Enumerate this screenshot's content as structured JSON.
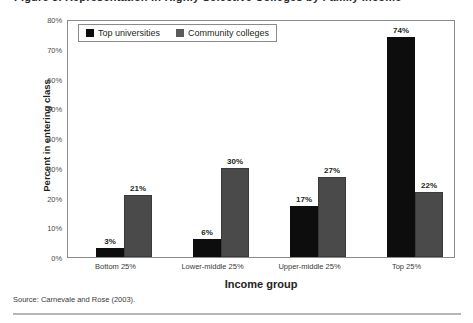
{
  "figure": {
    "title_remnant": "Figure 3. Representation in Highly Selective Colleges by Family Income",
    "source_note": "Source: Carnevale and Rose (2003).",
    "colors": {
      "series_top_universities": "#0d0d0d",
      "series_community_colleges": "#4a4a4a",
      "plot_border": "#8a8a8a",
      "axis_text": "#3a3a3a",
      "rule": "#b6b6bc",
      "background": "#ffffff"
    }
  },
  "legend": {
    "position": "top-left-inside",
    "items": [
      {
        "label": "Top universities",
        "swatch": "#0d0d0d"
      },
      {
        "label": "Community colleges",
        "swatch": "#5a5a5a"
      }
    ]
  },
  "axes": {
    "y_ticks": [
      "0%",
      "10%",
      "20%",
      "30%",
      "40%",
      "50%",
      "60%",
      "70%",
      "80%"
    ]
  },
  "chart_data": {
    "type": "bar",
    "title": "Figure 3. Representation in Highly Selective Colleges by Family Income",
    "xlabel": "Income group",
    "ylabel": "Percent in entering class",
    "categories": [
      "Bottom 25%",
      "Lower-middle 25%",
      "Upper-middle 25%",
      "Top 25%"
    ],
    "series": [
      {
        "name": "Top universities",
        "color": "#0d0d0d",
        "values": [
          3,
          6,
          17,
          74
        ],
        "labels": [
          "3%",
          "6%",
          "17%",
          "74%"
        ]
      },
      {
        "name": "Community colleges",
        "color": "#4a4a4a",
        "values": [
          21,
          30,
          27,
          22
        ],
        "labels": [
          "21%",
          "30%",
          "27%",
          "22%"
        ]
      }
    ],
    "ylim": [
      0,
      80
    ],
    "ytick_step": 10,
    "ytick_labels": [
      "0%",
      "10%",
      "20%",
      "30%",
      "40%",
      "50%",
      "60%",
      "70%",
      "80%"
    ],
    "grid": false,
    "legend_position": "upper left",
    "units": "percent",
    "source": "Carnevale and Rose (2003)."
  }
}
